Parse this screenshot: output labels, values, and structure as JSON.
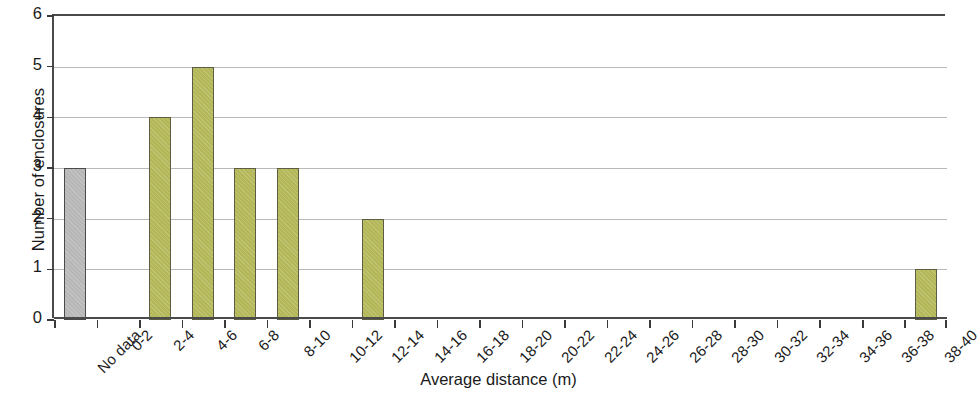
{
  "chart_data": {
    "type": "bar",
    "title": "",
    "xlabel": "Average distance (m)",
    "ylabel": "Number of enclosures",
    "categories": [
      "No data",
      "0-2",
      "2-4",
      "4-6",
      "6-8",
      "8-10",
      "10-12",
      "12-14",
      "14-16",
      "16-18",
      "18-20",
      "20-22",
      "22-24",
      "24-26",
      "26-28",
      "28-30",
      "30-32",
      "32-34",
      "34-36",
      "36-38",
      "38-40"
    ],
    "values": [
      3,
      0,
      4,
      5,
      3,
      3,
      0,
      2,
      0,
      0,
      0,
      0,
      0,
      0,
      0,
      0,
      0,
      0,
      0,
      0,
      1
    ],
    "ylim": [
      0,
      6
    ],
    "yticks": [
      0,
      1,
      2,
      3,
      4,
      5,
      6
    ],
    "ytick_labels": [
      "0",
      "1",
      "2",
      "3",
      "4",
      "5",
      "6"
    ],
    "grid": true,
    "grid_axis": "y",
    "legend": "none",
    "bar_colors": {
      "default": "#b3b757",
      "no_data": "#b7b7b7",
      "default_edge": "#5d5d44",
      "no_data_edge": "#4a4a4a"
    },
    "axis_color": "#4a4a4a",
    "gridline_color": "#b9b9b9",
    "xtick_label_rotation": -45
  }
}
